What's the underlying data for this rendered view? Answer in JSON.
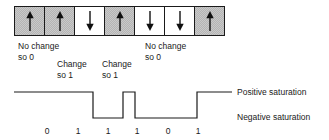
{
  "figure": {
    "domain_cells": [
      {
        "magnetization": "up",
        "shaded": true,
        "icon": "arrow-up-icon"
      },
      {
        "magnetization": "up",
        "shaded": true,
        "icon": "arrow-up-icon"
      },
      {
        "magnetization": "down",
        "shaded": false,
        "icon": "arrow-down-icon"
      },
      {
        "magnetization": "up",
        "shaded": true,
        "icon": "arrow-up-icon"
      },
      {
        "magnetization": "down",
        "shaded": false,
        "icon": "arrow-down-icon"
      },
      {
        "magnetization": "down",
        "shaded": false,
        "icon": "arrow-down-icon"
      },
      {
        "magnetization": "up",
        "shaded": true,
        "icon": "arrow-up-icon"
      }
    ],
    "annotations": [
      {
        "id": "no-change-1",
        "line1": "No change",
        "line2": "so 0"
      },
      {
        "id": "change-1",
        "line1": "Change",
        "line2": "so 1"
      },
      {
        "id": "change-2",
        "line1": "Change",
        "line2": "so 1"
      },
      {
        "id": "no-change-2",
        "line1": "No change",
        "line2": "so 0"
      }
    ],
    "saturation_labels": {
      "positive": "Positive saturation",
      "negative": "Negative saturation"
    },
    "bits": [
      "0",
      "1",
      "1",
      "1",
      "0",
      "1"
    ],
    "colors": {
      "line": "#1a1a1a",
      "shaded_cell": "#c9c9c9",
      "unshaded_cell": "#ffffff",
      "text": "#1a1a1a",
      "background": "#ffffff"
    },
    "waveform": {
      "high_level_y": 92,
      "low_level_y": 118,
      "start_x": 14,
      "end_x": 232,
      "transitions_x": [
        93,
        123,
        135,
        197
      ],
      "segments": [
        {
          "level": "high",
          "from_x": 14,
          "to_x": 93
        },
        {
          "level": "low",
          "from_x": 93,
          "to_x": 123
        },
        {
          "level": "high",
          "from_x": 123,
          "to_x": 135
        },
        {
          "level": "low",
          "from_x": 135,
          "to_x": 197
        },
        {
          "level": "high",
          "from_x": 197,
          "to_x": 232
        }
      ]
    }
  }
}
